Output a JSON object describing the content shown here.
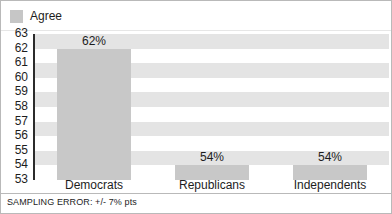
{
  "legend": {
    "swatch_name": "legend-swatch-agree",
    "label": "Agree",
    "color": "#c6c6c6"
  },
  "footer": {
    "note": "SAMPLING ERROR: +/- 7% pts"
  },
  "chart_data": {
    "type": "bar",
    "title": "",
    "subtitle": "",
    "xlabel": "",
    "ylabel": "",
    "categories": [
      "Democrats",
      "Republicans",
      "Independents"
    ],
    "values": [
      62,
      54,
      54
    ],
    "data_labels": [
      "62%",
      "54%",
      "54%"
    ],
    "series": [
      {
        "name": "Agree",
        "color": "#c8c8c8",
        "values": [
          62,
          54,
          54
        ]
      }
    ],
    "ylim": [
      53,
      63
    ],
    "yticks": [
      63,
      62,
      61,
      60,
      59,
      58,
      57,
      56,
      55,
      54,
      53
    ],
    "ytick_labels": [
      "63",
      "62",
      "61",
      "60",
      "59",
      "58",
      "57",
      "56",
      "55",
      "54",
      "53"
    ],
    "grid": false,
    "banding": "alternating-horizontal",
    "band_color": "#e4e4e4",
    "legend_position": "top-left",
    "legend_entries": [
      "Agree"
    ],
    "annotations": [
      "SAMPLING ERROR: +/- 7% pts"
    ]
  }
}
